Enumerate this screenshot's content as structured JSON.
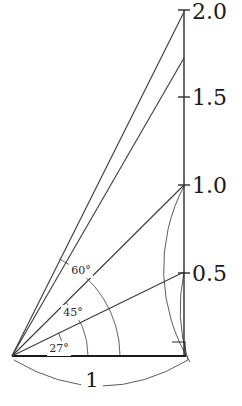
{
  "figure": {
    "width": 242,
    "height": 406,
    "background": "#ffffff",
    "ink_color": "#1a1a1a",
    "thin_ink_color": "#4a4a4a"
  },
  "axis": {
    "name": "vertical-value-axis",
    "x_px": 184,
    "bottom_px": 356,
    "top_px": 10,
    "unit_px_per_0_5": 87.7,
    "ticks": [
      {
        "label": "2.0",
        "value": 2.0,
        "y_px": 10,
        "label_x_px": 192,
        "label_y_px": 13
      },
      {
        "label": "1.5",
        "value": 1.5,
        "y_px": 97,
        "label_x_px": 192,
        "label_y_px": 99
      },
      {
        "label": "1.0",
        "value": 1.0,
        "y_px": 185,
        "label_x_px": 192,
        "label_y_px": 187
      },
      {
        "label": "0.5",
        "value": 0.5,
        "y_px": 273,
        "label_x_px": 192,
        "label_y_px": 275
      }
    ]
  },
  "origin": {
    "name": "vertex-origin",
    "x_px": 12,
    "y_px": 356
  },
  "base": {
    "name": "baseline-unit-segment",
    "label": "1",
    "label_x_px": 92,
    "label_y_px": 381,
    "from_x_px": 12,
    "from_y_px": 356,
    "to_x_px": 186,
    "to_y_px": 356
  },
  "rays": [
    {
      "name": "ray-baseline",
      "angle_label": "0",
      "angle_deg": 0,
      "heavy": true,
      "end_x_px": 186,
      "end_y_px": 356
    },
    {
      "name": "ray-27-degrees",
      "angle_label": "27°",
      "angle_deg": 27,
      "heavy": false,
      "end_x_px": 184,
      "end_y_px": 272
    },
    {
      "name": "ray-45-degrees",
      "angle_label": "45°",
      "angle_deg": 45,
      "heavy": false,
      "end_x_px": 184,
      "end_y_px": 185
    },
    {
      "name": "ray-60-degrees",
      "angle_label": "60°",
      "angle_deg": 60,
      "heavy": false,
      "end_x_px": 184,
      "end_y_px": 58
    },
    {
      "name": "ray-steepest",
      "angle_label": "",
      "angle_deg": 64,
      "heavy": false,
      "end_x_px": 184,
      "end_y_px": 12
    }
  ],
  "angle_labels": [
    {
      "name": "angle-label-27",
      "text": "27°",
      "x_px": 59,
      "y_px": 349
    },
    {
      "name": "angle-label-45",
      "text": "45°",
      "x_px": 73,
      "y_px": 313
    },
    {
      "name": "angle-label-60",
      "text": "60°",
      "x_px": 81,
      "y_px": 271
    }
  ],
  "angle_arcs": [
    {
      "name": "angle-arc-27",
      "radius_px": 52,
      "from_deg": 0,
      "to_deg": 27
    },
    {
      "name": "angle-arc-45",
      "radius_px": 76,
      "from_deg": 0,
      "to_deg": 45
    },
    {
      "name": "angle-arc-60",
      "radius_px": 108,
      "from_deg": 0,
      "to_deg": 64
    }
  ],
  "radius_arcs": [
    {
      "name": "radius-arc-to-0-5",
      "from_x_px": 184,
      "from_y_px": 272,
      "to_x_px": 188,
      "to_y_px": 360,
      "radius_px": 176
    },
    {
      "name": "radius-arc-to-1-0",
      "from_x_px": 184,
      "from_y_px": 186,
      "to_x_px": 190,
      "to_y_px": 362,
      "radius_px": 178
    }
  ],
  "dimension_arc": {
    "name": "dimension-arc-baseline",
    "from_x_px": 14,
    "from_y_px": 360,
    "to_x_px": 188,
    "to_y_px": 360,
    "sag_px": 26
  },
  "right_angle_marker": {
    "name": "right-angle-marker",
    "x_px": 172,
    "y_px": 342,
    "size_px": 13
  },
  "chart_data": {
    "type": "line",
    "xlabel": "",
    "ylabel": "",
    "ylim": [
      0,
      2.0
    ],
    "yticks": [
      0.5,
      1.0,
      1.5,
      2.0
    ],
    "ytick_labels": [
      "0.5",
      "1.0",
      "1.5",
      "2.0"
    ],
    "grid": false,
    "legend": "none",
    "annotations": [
      "27°",
      "45°",
      "60°",
      "1"
    ],
    "series": [
      {
        "name": "baseline (length 1)",
        "x": [
          0,
          1
        ],
        "y": [
          0,
          0
        ]
      },
      {
        "name": "ray at 27° (tan 27 ≈ 0.5)",
        "x": [
          0,
          1
        ],
        "y": [
          0,
          0.48
        ]
      },
      {
        "name": "ray at 45° (tan 45 = 1)",
        "x": [
          0,
          1
        ],
        "y": [
          0,
          1.0
        ]
      },
      {
        "name": "ray at 60° (tan 60 ≈ 1.73)",
        "x": [
          0,
          1
        ],
        "y": [
          0,
          1.73
        ]
      },
      {
        "name": "ray to 2.0",
        "x": [
          0,
          1
        ],
        "y": [
          0,
          2.0
        ]
      }
    ]
  }
}
